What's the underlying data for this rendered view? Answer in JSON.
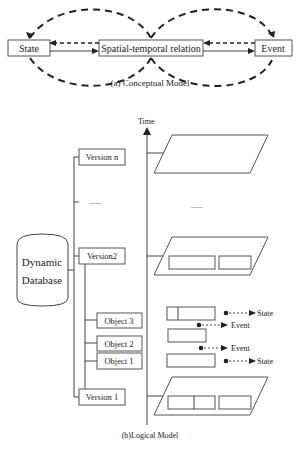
{
  "conceptual_model": {
    "nodes": {
      "state": "State",
      "relation": "Spatial-temporal relation",
      "event": "Event"
    },
    "caption": "(a) Conceptual Model"
  },
  "logical_model": {
    "time_axis_label": "Time",
    "database_line1": "Dynamic",
    "database_line2": "Database",
    "versions": {
      "n": "Version n",
      "ellipsis": "......",
      "v2": "Version2",
      "v1": "Version 1"
    },
    "objects": {
      "o3": "Object 3",
      "o2": "Object 2",
      "o1": "Object 1"
    },
    "layer_ellipsis": "......",
    "annotations": {
      "a1": "State",
      "a2": "Event",
      "a3": "Event",
      "a4": "State"
    },
    "caption": "(b)Logical Model"
  }
}
